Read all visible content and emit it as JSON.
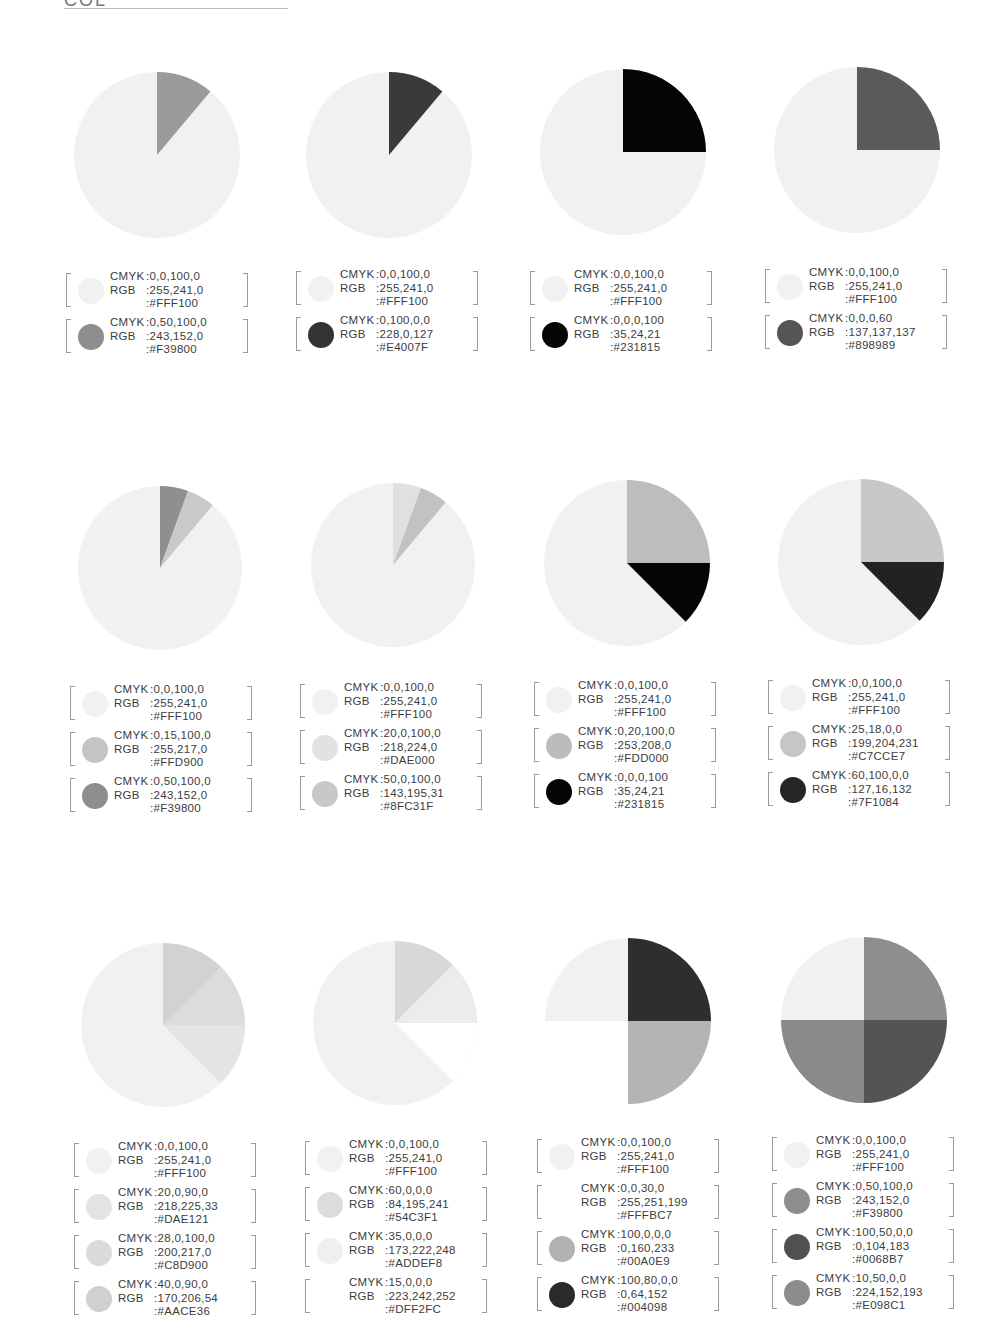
{
  "page": {
    "title_partial": "COL",
    "rule": true
  },
  "chart_data": [
    {
      "type": "pie",
      "title": "Palette 1",
      "slices": [
        {
          "start": 0,
          "end": 40,
          "hex": "#F39800",
          "gray": "#9a9a9a"
        }
      ],
      "base": {
        "hex": "#FFF100",
        "gray": "#f1f1f1"
      },
      "legend": [
        {
          "cmyk": "0,0,100,0",
          "rgb": "255,241,0",
          "hex": "#FFF100",
          "gray": "#f1f1f1"
        },
        {
          "cmyk": "0,50,100,0",
          "rgb": "243,152,0",
          "hex": "#F39800",
          "gray": "#8e8e8e"
        }
      ]
    },
    {
      "type": "pie",
      "title": "Palette 2",
      "slices": [
        {
          "start": 0,
          "end": 40,
          "hex": "#E4007F",
          "gray": "#3a3a3a"
        }
      ],
      "base": {
        "hex": "#FFF100",
        "gray": "#f1f1f1"
      },
      "legend": [
        {
          "cmyk": "0,0,100,0",
          "rgb": "255,241,0",
          "hex": "#FFF100",
          "gray": "#f1f1f1"
        },
        {
          "cmyk": "0,100,0,0",
          "rgb": "228,0,127",
          "hex": "#E4007F",
          "gray": "#333333"
        }
      ]
    },
    {
      "type": "pie",
      "title": "Palette 3",
      "slices": [
        {
          "start": 0,
          "end": 90,
          "hex": "#231815",
          "gray": "#050505"
        }
      ],
      "base": {
        "hex": "#FFF100",
        "gray": "#f1f1f1"
      },
      "legend": [
        {
          "cmyk": "0,0,100,0",
          "rgb": "255,241,0",
          "hex": "#FFF100",
          "gray": "#f1f1f1"
        },
        {
          "cmyk": "0,0,0,100",
          "rgb": "35,24,21",
          "hex": "#231815",
          "gray": "#050505"
        }
      ]
    },
    {
      "type": "pie",
      "title": "Palette 4",
      "slices": [
        {
          "start": 0,
          "end": 90,
          "hex": "#898989",
          "gray": "#5a5a5a"
        }
      ],
      "base": {
        "hex": "#FFF100",
        "gray": "#f1f1f1"
      },
      "legend": [
        {
          "cmyk": "0,0,100,0",
          "rgb": "255,241,0",
          "hex": "#FFF100",
          "gray": "#f1f1f1"
        },
        {
          "cmyk": "0,0,0,60",
          "rgb": "137,137,137",
          "hex": "#898989",
          "gray": "#555555"
        }
      ]
    },
    {
      "type": "pie",
      "title": "Palette 5",
      "slices": [
        {
          "start": 0,
          "end": 20,
          "hex": "#F39800",
          "gray": "#8f8f8f"
        },
        {
          "start": 20,
          "end": 40,
          "hex": "#FFD900",
          "gray": "#c9c9c9"
        }
      ],
      "base": {
        "hex": "#FFF100",
        "gray": "#f1f1f1"
      },
      "legend": [
        {
          "cmyk": "0,0,100,0",
          "rgb": "255,241,0",
          "hex": "#FFF100",
          "gray": "#f1f1f1"
        },
        {
          "cmyk": "0,15,100,0",
          "rgb": "255,217,0",
          "hex": "#FFD900",
          "gray": "#c4c4c4"
        },
        {
          "cmyk": "0,50,100,0",
          "rgb": "243,152,0",
          "hex": "#F39800",
          "gray": "#8e8e8e"
        }
      ]
    },
    {
      "type": "pie",
      "title": "Palette 6",
      "slices": [
        {
          "start": 0,
          "end": 20,
          "hex": "#DAE000",
          "gray": "#e0e0e0"
        },
        {
          "start": 20,
          "end": 40,
          "hex": "#8FC31F",
          "gray": "#c2c2c2"
        }
      ],
      "base": {
        "hex": "#FFF100",
        "gray": "#f1f1f1"
      },
      "legend": [
        {
          "cmyk": "0,0,100,0",
          "rgb": "255,241,0",
          "hex": "#FFF100",
          "gray": "#f1f1f1"
        },
        {
          "cmyk": "20,0,100,0",
          "rgb": "218,224,0",
          "hex": "#DAE000",
          "gray": "#e2e2e2"
        },
        {
          "cmyk": "50,0,100,0",
          "rgb": "143,195,31",
          "hex": "#8FC31F",
          "gray": "#c8c8c8"
        }
      ]
    },
    {
      "type": "pie",
      "title": "Palette 7",
      "slices": [
        {
          "start": 0,
          "end": 90,
          "hex": "#FDD000",
          "gray": "#bdbdbd"
        },
        {
          "start": 90,
          "end": 135,
          "hex": "#231815",
          "gray": "#050505"
        }
      ],
      "base": {
        "hex": "#FFF100",
        "gray": "#f1f1f1"
      },
      "legend": [
        {
          "cmyk": "0,0,100,0",
          "rgb": "255,241,0",
          "hex": "#FFF100",
          "gray": "#f1f1f1"
        },
        {
          "cmyk": "0,20,100,0",
          "rgb": "253,208,0",
          "hex": "#FDD000",
          "gray": "#bcbcbc"
        },
        {
          "cmyk": "0,0,0,100",
          "rgb": "35,24,21",
          "hex": "#231815",
          "gray": "#050505"
        }
      ]
    },
    {
      "type": "pie",
      "title": "Palette 8",
      "slices": [
        {
          "start": 0,
          "end": 90,
          "hex": "#C7CCE7",
          "gray": "#c8c8c8"
        },
        {
          "start": 90,
          "end": 135,
          "hex": "#7F1084",
          "gray": "#222222"
        }
      ],
      "base": {
        "hex": "#FFF100",
        "gray": "#f1f1f1"
      },
      "legend": [
        {
          "cmyk": "0,0,100,0",
          "rgb": "255,241,0",
          "hex": "#FFF100",
          "gray": "#f1f1f1"
        },
        {
          "cmyk": "25,18,0,0",
          "rgb": "199,204,231",
          "hex": "#C7CCE7",
          "gray": "#c6c6c6"
        },
        {
          "cmyk": "60,100,0,0",
          "rgb": "127,16,132",
          "hex": "#7F1084",
          "gray": "#262626"
        }
      ]
    },
    {
      "type": "pie",
      "title": "Palette 9",
      "slices": [
        {
          "start": 0,
          "end": 45,
          "hex": "#AACE36",
          "gray": "#d2d2d2"
        },
        {
          "start": 45,
          "end": 90,
          "hex": "#C8D900",
          "gray": "#dcdcdc"
        },
        {
          "start": 90,
          "end": 135,
          "hex": "#DAE121",
          "gray": "#e4e4e4"
        }
      ],
      "base": {
        "hex": "#FFF100",
        "gray": "#f1f1f1"
      },
      "legend": [
        {
          "cmyk": "0,0,100,0",
          "rgb": "255,241,0",
          "hex": "#FFF100",
          "gray": "#f1f1f1"
        },
        {
          "cmyk": "20,0,90,0",
          "rgb": "218,225,33",
          "hex": "#DAE121",
          "gray": "#e3e3e3"
        },
        {
          "cmyk": "28,0,100,0",
          "rgb": "200,217,0",
          "hex": "#C8D900",
          "gray": "#dadada"
        },
        {
          "cmyk": "40,0,90,0",
          "rgb": "170,206,54",
          "hex": "#AACE36",
          "gray": "#d0d0d0"
        }
      ]
    },
    {
      "type": "pie",
      "title": "Palette 10",
      "slices": [
        {
          "start": 0,
          "end": 45,
          "hex": "#54C3F1",
          "gray": "#d8d8d8"
        },
        {
          "start": 45,
          "end": 90,
          "hex": "#ADDEF8",
          "gray": "#ececec"
        },
        {
          "start": 90,
          "end": 135,
          "hex": "#DFF2FC",
          "gray": "#ffffff"
        }
      ],
      "base": {
        "hex": "#FFF100",
        "gray": "#f1f1f1"
      },
      "legend": [
        {
          "cmyk": "0,0,100,0",
          "rgb": "255,241,0",
          "hex": "#FFF100",
          "gray": "#f1f1f1"
        },
        {
          "cmyk": "60,0,0,0",
          "rgb": "84,195,241",
          "hex": "#54C3F1",
          "gray": "#dcdcdc"
        },
        {
          "cmyk": "35,0,0,0",
          "rgb": "173,222,248",
          "hex": "#ADDEF8",
          "gray": "#efefef"
        },
        {
          "cmyk": "15,0,0,0",
          "rgb": "223,242,252",
          "hex": "#DFF2FC",
          "gray": "#ffffff"
        }
      ]
    },
    {
      "type": "pie",
      "title": "Palette 11",
      "slices": [
        {
          "start": 0,
          "end": 90,
          "hex": "#004098",
          "gray": "#2e2e2e"
        },
        {
          "start": 90,
          "end": 180,
          "hex": "#00A0E9",
          "gray": "#b4b4b4"
        },
        {
          "start": 180,
          "end": 270,
          "hex": "#FFFBC7",
          "gray": "#ffffff"
        },
        {
          "start": 270,
          "end": 360,
          "hex": "#FFF100",
          "gray": "#f1f1f1"
        }
      ],
      "legend": [
        {
          "cmyk": "0,0,100,0",
          "rgb": "255,241,0",
          "hex": "#FFF100",
          "gray": "#f1f1f1"
        },
        {
          "cmyk": "0,0,30,0",
          "rgb": "255,251,199",
          "hex": "#FFFBC7",
          "gray": "#ffffff"
        },
        {
          "cmyk": "100,0,0,0",
          "rgb": "0,160,233",
          "hex": "#00A0E9",
          "gray": "#b2b2b2"
        },
        {
          "cmyk": "100,80,0,0",
          "rgb": "0,64,152",
          "hex": "#004098",
          "gray": "#2a2a2a"
        }
      ]
    },
    {
      "type": "pie",
      "title": "Palette 12",
      "slices": [
        {
          "start": 0,
          "end": 90,
          "hex": "#F39800",
          "gray": "#8e8e8e"
        },
        {
          "start": 90,
          "end": 180,
          "hex": "#0068B7",
          "gray": "#545454"
        },
        {
          "start": 180,
          "end": 270,
          "hex": "#E098C1",
          "gray": "#8a8a8a"
        },
        {
          "start": 270,
          "end": 360,
          "hex": "#FFF100",
          "gray": "#f1f1f1"
        }
      ],
      "legend": [
        {
          "cmyk": "0,0,100,0",
          "rgb": "255,241,0",
          "hex": "#FFF100",
          "gray": "#f1f1f1"
        },
        {
          "cmyk": "0,50,100,0",
          "rgb": "243,152,0",
          "hex": "#F39800",
          "gray": "#8e8e8e"
        },
        {
          "cmyk": "100,50,0,0",
          "rgb": "0,104,183",
          "hex": "#0068B7",
          "gray": "#505050"
        },
        {
          "cmyk": "10,50,0,0",
          "rgb": "224,152,193",
          "hex": "#E098C1",
          "gray": "#8c8c8c"
        }
      ]
    }
  ],
  "labels": {
    "cmyk": "CMYK",
    "rgb": "RGB"
  },
  "layout": {
    "pies": [
      {
        "cx": 157,
        "cy": 155,
        "r": 83,
        "lx": 66,
        "ly": 270
      },
      {
        "cx": 389,
        "cy": 155,
        "r": 83,
        "lx": 296,
        "ly": 268
      },
      {
        "cx": 623,
        "cy": 152,
        "r": 83,
        "lx": 530,
        "ly": 268
      },
      {
        "cx": 857,
        "cy": 150,
        "r": 83,
        "lx": 765,
        "ly": 266
      },
      {
        "cx": 160,
        "cy": 568,
        "r": 82,
        "lx": 70,
        "ly": 683
      },
      {
        "cx": 393,
        "cy": 565,
        "r": 82,
        "lx": 300,
        "ly": 681
      },
      {
        "cx": 627,
        "cy": 563,
        "r": 83,
        "lx": 534,
        "ly": 679
      },
      {
        "cx": 861,
        "cy": 562,
        "r": 83,
        "lx": 768,
        "ly": 677
      },
      {
        "cx": 163,
        "cy": 1025,
        "r": 82,
        "lx": 74,
        "ly": 1140
      },
      {
        "cx": 395,
        "cy": 1023,
        "r": 82,
        "lx": 305,
        "ly": 1138
      },
      {
        "cx": 628,
        "cy": 1021,
        "r": 83,
        "lx": 537,
        "ly": 1136
      },
      {
        "cx": 864,
        "cy": 1020,
        "r": 83,
        "lx": 772,
        "ly": 1134
      }
    ]
  }
}
